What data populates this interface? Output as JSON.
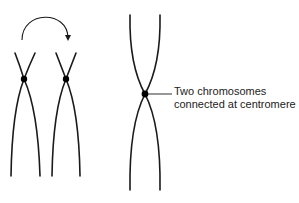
{
  "diagram": {
    "title": "",
    "label": {
      "line1": "Two chromosomes",
      "line2": "connected at centromere"
    },
    "colors": {
      "stroke": "#1a1a1a",
      "centromere": "#000000",
      "background": "#ffffff",
      "text": "#222222"
    },
    "elements": [
      {
        "id": "chromosome-a",
        "type": "chromatid-pair",
        "centromere": [
          24,
          79
        ]
      },
      {
        "id": "chromosome-b",
        "type": "chromatid-pair",
        "centromere": [
          66,
          79
        ]
      },
      {
        "id": "curved-arrow",
        "type": "arrow",
        "from": "chromosome-a",
        "to": "chromosome-b"
      },
      {
        "id": "combined-chromosome",
        "type": "chromatid-pair",
        "centromere": [
          145,
          94
        ]
      }
    ]
  }
}
